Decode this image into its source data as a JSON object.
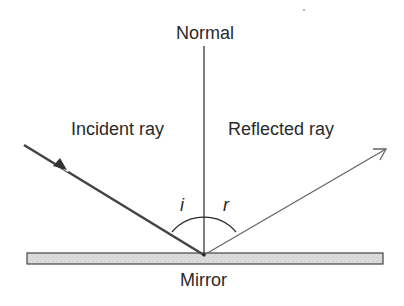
{
  "diagram": {
    "type": "law-of-reflection",
    "labels": {
      "normal": "Normal",
      "incident_ray": "Incident ray",
      "reflected_ray": "Reflected ray",
      "mirror": "Mirror",
      "angle_incidence": "i",
      "angle_reflection": "r"
    },
    "colors": {
      "line": "#2a2a2a",
      "incident_ray": "#444444",
      "reflected_ray": "#666666",
      "mirror_fill": "#d8d8d8",
      "mirror_stroke": "#444444",
      "background": "#ffffff"
    }
  }
}
